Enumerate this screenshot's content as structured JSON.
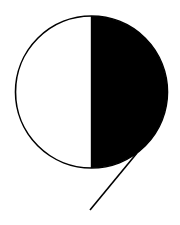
{
  "figure": {
    "colors": {
      "background": "#ffffff",
      "fill": "#000000",
      "stroke": "#000000"
    },
    "circle": {
      "cx": 91.5,
      "cy": 92,
      "r": 76
    },
    "tail": {
      "x1": 137,
      "y1": 153,
      "x2": 90,
      "y2": 210
    }
  }
}
